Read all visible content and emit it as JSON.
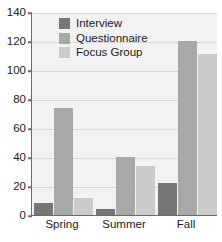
{
  "chart_data": {
    "type": "bar",
    "title": "",
    "subtitle": "",
    "xlabel": "",
    "ylabel": "",
    "categories": [
      "Spring",
      "Summer",
      "Fall"
    ],
    "series": [
      {
        "name": "Interview",
        "values": [
          8,
          4,
          22
        ],
        "color": "#767676"
      },
      {
        "name": "Questionnaire",
        "values": [
          74,
          40,
          120
        ],
        "color": "#a8a8a8"
      },
      {
        "name": "Focus Group",
        "values": [
          12,
          34,
          111
        ],
        "color": "#cbcbcb"
      }
    ],
    "ylim": [
      0,
      140
    ],
    "ytick_values": [
      0,
      20,
      40,
      60,
      80,
      100,
      120,
      140
    ],
    "ytick_labels": [
      "0",
      "20",
      "40",
      "60",
      "80",
      "100",
      "120",
      "140"
    ],
    "grid": true,
    "grid_axis": "y",
    "legend_position": "upper left inside",
    "plot_background": "#f2f2f2",
    "gridline_color": "#d9d9d9",
    "axis_color": "#6b6b6b",
    "text_color": "#1a1a1a"
  }
}
